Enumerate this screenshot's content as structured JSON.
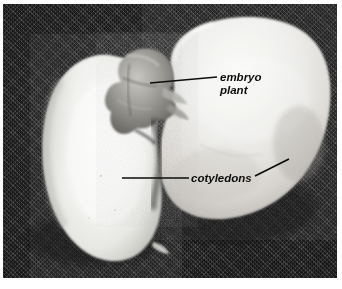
{
  "figure": {
    "kind": "photograph",
    "background_color": "#272727",
    "plate_border_color": "#ffffff"
  },
  "annotations": [
    {
      "id": "embryo-plant",
      "label_line_1": "embryo",
      "label_line_2": "plant",
      "text_color": "#0c0c0c",
      "leader": {
        "x1": 147,
        "y1": 79,
        "x2": 214,
        "y2": 73
      },
      "text_x": 217,
      "text_y_1": 77,
      "text_y_2": 90
    },
    {
      "id": "cotyledons",
      "label_line_1": "cotyledons",
      "label_line_2": "",
      "text_color": "#0c0c0c",
      "leader": {
        "x1": 119,
        "y1": 174,
        "x2": 186,
        "y2": 174
      },
      "leader_2": {
        "x1": 252,
        "y1": 172,
        "x2": 286,
        "y2": 155
      },
      "text_x": 188,
      "text_y_1": 178,
      "text_y_2": 0
    }
  ],
  "specimen_parts": [
    {
      "id": "left-cotyledon",
      "name": "cotyledon-left",
      "fill": "#f2f2f0",
      "description": "elongated oval half of the bean seed"
    },
    {
      "id": "right-cotyledon",
      "name": "cotyledon-right",
      "fill": "#ececea",
      "description": "large kidney shaped half of the bean seed"
    },
    {
      "id": "embryo",
      "name": "embryo-plant",
      "fill": "#8f8f8c",
      "description": "crumpled grey embryo tissue between the cotyledons"
    }
  ]
}
